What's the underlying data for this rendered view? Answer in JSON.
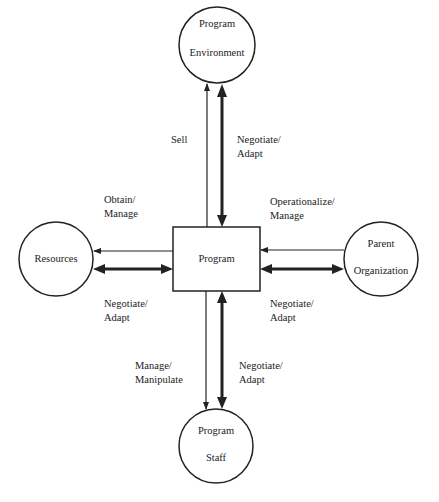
{
  "diagram": {
    "center": {
      "label": "Program"
    },
    "nodes": {
      "top": {
        "line1": "Program",
        "line2": "Environment"
      },
      "left": {
        "line1": "Resources"
      },
      "right": {
        "line1": "Parent",
        "line2": "Organization"
      },
      "bottom": {
        "line1": "Program",
        "line2": "Staff"
      }
    },
    "edges": {
      "top_thin": "Sell",
      "top_thick": "Negotiate/\nAdapt",
      "left_thin": "Obtain/\nManage",
      "left_thick": "Negotiate/\nAdapt",
      "right_thin": "Operationalize/\nManage",
      "right_thick": "Negotiate/\nAdapt",
      "bottom_thin": "Manage/\nManipulate",
      "bottom_thick": "Negotiate/\nAdapt"
    }
  }
}
